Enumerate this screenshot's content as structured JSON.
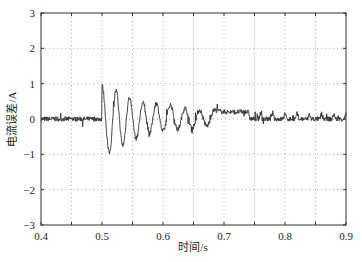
{
  "chart_data": {
    "type": "line",
    "title": "",
    "xlabel": "时间/s",
    "ylabel": "电流误差/A",
    "xlim": [
      0.4,
      0.9
    ],
    "ylim": [
      -3,
      3
    ],
    "xticks": [
      0.4,
      0.5,
      0.6,
      0.7,
      0.8,
      0.9
    ],
    "xtick_labels": [
      "0.4",
      "0.5",
      "0.6",
      "0.7",
      "0.8",
      "0.9"
    ],
    "yticks": [
      -3,
      -2,
      -1,
      0,
      1,
      2,
      3
    ],
    "ytick_labels": [
      "−3",
      "−2",
      "−1",
      "0",
      "1",
      "2",
      "3"
    ],
    "grid": true,
    "grid_style": "dotted",
    "legend": null,
    "series": [
      {
        "name": "current error",
        "color": "#333333",
        "description": "noisy signal around 0 (±0.1) until t=0.5 s, then a damped oscillation with decaying peaks",
        "noise_amplitude": 0.1,
        "transient_start": 0.5,
        "peaks": [
          {
            "x": 0.5,
            "y": 0.95
          },
          {
            "x": 0.512,
            "y": -0.95
          },
          {
            "x": 0.523,
            "y": 0.8
          },
          {
            "x": 0.534,
            "y": -0.75
          },
          {
            "x": 0.545,
            "y": 0.6
          },
          {
            "x": 0.556,
            "y": -0.55
          },
          {
            "x": 0.567,
            "y": 0.45
          },
          {
            "x": 0.578,
            "y": -0.4
          },
          {
            "x": 0.589,
            "y": 0.45
          },
          {
            "x": 0.6,
            "y": -0.35
          },
          {
            "x": 0.612,
            "y": 0.4
          },
          {
            "x": 0.624,
            "y": -0.3
          },
          {
            "x": 0.636,
            "y": 0.3
          },
          {
            "x": 0.648,
            "y": -0.25
          },
          {
            "x": 0.66,
            "y": 0.25
          },
          {
            "x": 0.672,
            "y": -0.2
          },
          {
            "x": 0.684,
            "y": 0.25
          },
          {
            "x": 0.7,
            "y": 0.2
          },
          {
            "x": 0.72,
            "y": 0.2
          },
          {
            "x": 0.74,
            "y": 0.2
          }
        ],
        "steady_state_after": 0.75
      }
    ]
  }
}
